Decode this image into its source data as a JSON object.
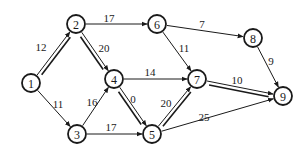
{
  "diagram": {
    "type": "project-network",
    "colors": {
      "stroke": "#1a1a1a",
      "background": "#ffffff"
    },
    "node_radius": 9,
    "nodes": [
      {
        "id": "1",
        "label": "1",
        "x": 31,
        "y": 83
      },
      {
        "id": "2",
        "label": "2",
        "x": 76,
        "y": 24
      },
      {
        "id": "3",
        "label": "3",
        "x": 77,
        "y": 134
      },
      {
        "id": "4",
        "label": "4",
        "x": 114,
        "y": 79
      },
      {
        "id": "5",
        "label": "5",
        "x": 152,
        "y": 134
      },
      {
        "id": "6",
        "label": "6",
        "x": 157,
        "y": 24
      },
      {
        "id": "7",
        "label": "7",
        "x": 197,
        "y": 79
      },
      {
        "id": "8",
        "label": "8",
        "x": 253,
        "y": 38
      },
      {
        "id": "9",
        "label": "9",
        "x": 283,
        "y": 96
      }
    ],
    "edges": [
      {
        "from": "1",
        "to": "2",
        "weight": "12",
        "critical": true,
        "label_x": 41,
        "label_y": 47
      },
      {
        "from": "1",
        "to": "3",
        "weight": "11",
        "critical": false,
        "label_x": 58,
        "label_y": 104
      },
      {
        "from": "2",
        "to": "6",
        "weight": "17",
        "critical": false,
        "label_x": 109,
        "label_y": 18
      },
      {
        "from": "2",
        "to": "4",
        "weight": "20",
        "critical": true,
        "label_x": 104,
        "label_y": 48
      },
      {
        "from": "3",
        "to": "4",
        "weight": "16",
        "critical": false,
        "label_x": 92,
        "label_y": 102
      },
      {
        "from": "3",
        "to": "5",
        "weight": "17",
        "critical": false,
        "label_x": 111,
        "label_y": 127
      },
      {
        "from": "4",
        "to": "7",
        "weight": "14",
        "critical": false,
        "label_x": 150,
        "label_y": 72
      },
      {
        "from": "4",
        "to": "5",
        "weight": "0",
        "critical": true,
        "label_x": 133,
        "label_y": 99
      },
      {
        "from": "5",
        "to": "7",
        "weight": "20",
        "critical": true,
        "label_x": 166,
        "label_y": 103
      },
      {
        "from": "5",
        "to": "9",
        "weight": "25",
        "critical": false,
        "label_x": 204,
        "label_y": 117
      },
      {
        "from": "6",
        "to": "7",
        "weight": "11",
        "critical": false,
        "label_x": 184,
        "label_y": 48
      },
      {
        "from": "6",
        "to": "8",
        "weight": "7",
        "critical": false,
        "label_x": 202,
        "label_y": 24
      },
      {
        "from": "7",
        "to": "9",
        "weight": "10",
        "critical": true,
        "label_x": 237,
        "label_y": 80
      },
      {
        "from": "8",
        "to": "9",
        "weight": "9",
        "critical": false,
        "label_x": 271,
        "label_y": 61
      }
    ]
  }
}
